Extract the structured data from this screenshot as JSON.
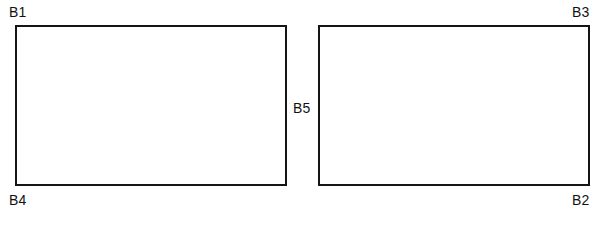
{
  "figure": {
    "background_color": "#ffffff",
    "line_color": "#151515",
    "label_color": "#121212"
  },
  "shapes": [
    {
      "id": "rect-left",
      "kind": "rectangle",
      "x": 15,
      "y": 25,
      "width": 272,
      "height": 161,
      "stroke_width": 2,
      "fill": "#ffffff"
    },
    {
      "id": "rect-right",
      "kind": "rectangle",
      "x": 318,
      "y": 25,
      "width": 272,
      "height": 161,
      "stroke_width": 2,
      "fill": "#ffffff"
    }
  ],
  "labels": {
    "b1": "B1",
    "b2": "B2",
    "b3": "B3",
    "b4": "B4",
    "b5": "B5"
  }
}
